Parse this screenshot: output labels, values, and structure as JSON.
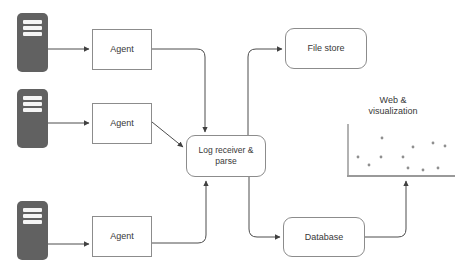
{
  "diagram": {
    "nodes": {
      "server1": {
        "icon": "server-icon"
      },
      "server2": {
        "icon": "server-icon"
      },
      "server3": {
        "icon": "server-icon"
      },
      "agent1": {
        "label": "Agent"
      },
      "agent2": {
        "label": "Agent"
      },
      "agent3": {
        "label": "Agent"
      },
      "file_store": {
        "label": "File store"
      },
      "log_receiver": {
        "label": "Log receiver & parse"
      },
      "database": {
        "label": "Database"
      },
      "web_visualization": {
        "label_line1": "Web &",
        "label_line2": "visualization"
      }
    },
    "scatter_plot": {
      "dots": [
        [
          358,
          157
        ],
        [
          369,
          165
        ],
        [
          381,
          157
        ],
        [
          382,
          138
        ],
        [
          403,
          157
        ],
        [
          408,
          168
        ],
        [
          413,
          147
        ],
        [
          423,
          170
        ],
        [
          433,
          143
        ],
        [
          438,
          168
        ],
        [
          445,
          146
        ]
      ],
      "dot_color": "#8f8f8f",
      "axis_color": "#999999"
    },
    "colors": {
      "background": "#ffffff",
      "server_fill": "#616161",
      "box_border": "#8c8c8c",
      "arrow": "#4d4d4d",
      "text": "#383838"
    }
  }
}
